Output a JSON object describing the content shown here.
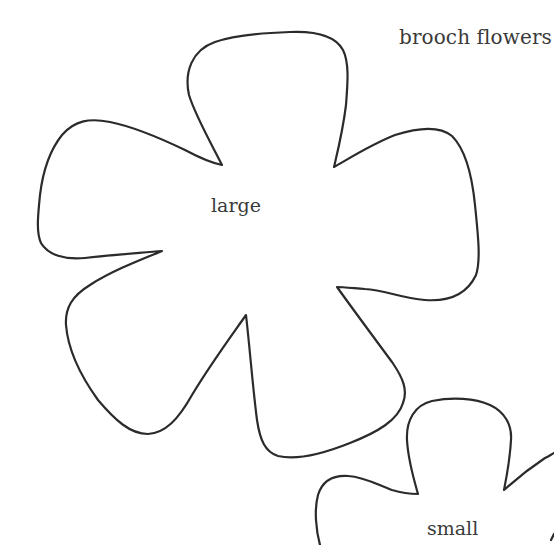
{
  "page": {
    "title": "brooch flowers"
  },
  "templates": [
    {
      "id": "large",
      "label": "large",
      "petals": 5,
      "stroke_color": "#2b2b2b"
    },
    {
      "id": "small",
      "label": "small",
      "petals": 5,
      "stroke_color": "#2b2b2b",
      "partially_visible": true
    }
  ],
  "colors": {
    "background": "#ffffff",
    "outline": "#2b2b2b",
    "text": "#3a3a3a"
  }
}
